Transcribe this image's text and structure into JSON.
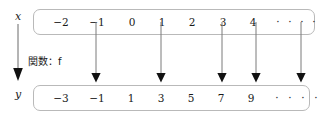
{
  "diagram": {
    "title_note": "関数：f",
    "function_symbol": "f",
    "domain_label": "x",
    "codomain_label": "y",
    "colors": {
      "box_border": "#b9b9b9",
      "text": "#1a1a1a",
      "arrow": "#111111",
      "map_arrow": "#555555"
    },
    "domain_set": {
      "name": "x",
      "items": [
        {
          "label": "−2",
          "x": 27,
          "is_dot": false
        },
        {
          "label": "−1",
          "x": 63,
          "is_dot": false
        },
        {
          "label": "0",
          "x": 98,
          "is_dot": false
        },
        {
          "label": "1",
          "x": 128,
          "is_dot": false
        },
        {
          "label": "2",
          "x": 158,
          "is_dot": false
        },
        {
          "label": "3",
          "x": 189,
          "is_dot": false
        },
        {
          "label": "4",
          "x": 219,
          "is_dot": false
        },
        {
          "label": "·",
          "x": 244,
          "is_dot": true
        },
        {
          "label": "·",
          "x": 256,
          "is_dot": true
        },
        {
          "label": "·",
          "x": 268,
          "is_dot": true
        },
        {
          "label": "·",
          "x": 280,
          "is_dot": true
        }
      ]
    },
    "codomain_set": {
      "name": "y",
      "items": [
        {
          "label": "−3",
          "x": 27,
          "is_dot": false
        },
        {
          "label": "−1",
          "x": 63,
          "is_dot": false
        },
        {
          "label": "1",
          "x": 97,
          "is_dot": false
        },
        {
          "label": "3",
          "x": 127,
          "is_dot": false
        },
        {
          "label": "5",
          "x": 157,
          "is_dot": false
        },
        {
          "label": "7",
          "x": 187,
          "is_dot": false
        },
        {
          "label": "9",
          "x": 217,
          "is_dot": false
        },
        {
          "label": "·",
          "x": 243,
          "is_dot": true
        },
        {
          "label": "·",
          "x": 256,
          "is_dot": true
        },
        {
          "label": "·",
          "x": 269,
          "is_dot": true
        },
        {
          "label": "·",
          "x": 282,
          "is_dot": true
        }
      ]
    },
    "mappings": [
      {
        "from_label": "−1",
        "to_label": "−1",
        "x": 96
      },
      {
        "from_label": "1",
        "to_label": "3",
        "x": 161
      },
      {
        "from_label": "3",
        "to_label": "7",
        "x": 222
      },
      {
        "from_label": "·",
        "to_label": "·",
        "x": 256
      },
      {
        "from_label": "·",
        "to_label": "·",
        "x": 301
      }
    ],
    "mapping_arrow_top": 35,
    "mapping_arrow_bottom": 83
  }
}
